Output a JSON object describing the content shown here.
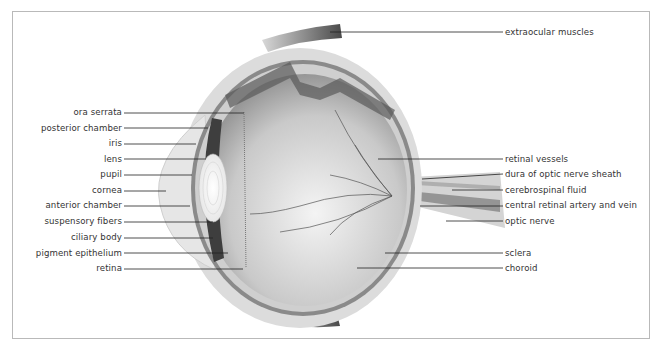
{
  "diagram": {
    "left_labels": [
      {
        "text": "ora serrata",
        "y": 112
      },
      {
        "text": "posterior chamber",
        "y": 128
      },
      {
        "text": "iris",
        "y": 143
      },
      {
        "text": "lens",
        "y": 159
      },
      {
        "text": "pupil",
        "y": 174
      },
      {
        "text": "cornea",
        "y": 190
      },
      {
        "text": "anterior chamber",
        "y": 205
      },
      {
        "text": "suspensory fibers",
        "y": 221
      },
      {
        "text": "ciliary body",
        "y": 237
      },
      {
        "text": "pigment epithelium",
        "y": 253
      },
      {
        "text": "retina",
        "y": 268
      }
    ],
    "right_labels": [
      {
        "text": "extraocular muscles",
        "y": 32
      },
      {
        "text": "retinal vessels",
        "y": 159
      },
      {
        "text": "dura of optic nerve sheath",
        "y": 174
      },
      {
        "text": "cerebrospinal fluid",
        "y": 190
      },
      {
        "text": "central retinal artery and vein",
        "y": 205
      },
      {
        "text": "optic nerve",
        "y": 221
      },
      {
        "text": "sclera",
        "y": 253
      },
      {
        "text": "choroid",
        "y": 268
      }
    ]
  }
}
